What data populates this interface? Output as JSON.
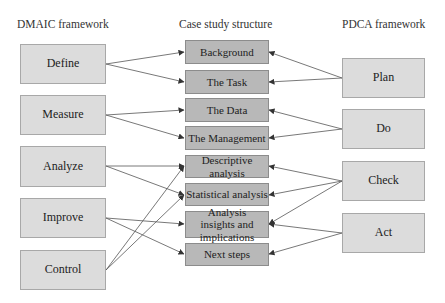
{
  "headings": {
    "left": "DMAIC framework",
    "middle": "Case study structure",
    "right": "PDCA framework"
  },
  "dmaic": [
    "Define",
    "Measure",
    "Analyze",
    "Improve",
    "Control"
  ],
  "case_study": [
    "Background",
    "The Task",
    "The Data",
    "The Management",
    "Descriptive analysis",
    "Statistical analysis",
    "Analysis insights and implications",
    "Next steps"
  ],
  "pdca": [
    "Plan",
    "Do",
    "Check",
    "Act"
  ],
  "connections": {
    "dmaic_to_case": [
      [
        "Define",
        "Background"
      ],
      [
        "Define",
        "The Task"
      ],
      [
        "Measure",
        "The Data"
      ],
      [
        "Measure",
        "The Management"
      ],
      [
        "Analyze",
        "Descriptive analysis"
      ],
      [
        "Analyze",
        "Statistical analysis"
      ],
      [
        "Improve",
        "Analysis insights and implications"
      ],
      [
        "Improve",
        "Next steps"
      ],
      [
        "Control",
        "Descriptive analysis"
      ],
      [
        "Control",
        "Statistical analysis"
      ]
    ],
    "pdca_to_case": [
      [
        "Plan",
        "Background"
      ],
      [
        "Plan",
        "The Task"
      ],
      [
        "Do",
        "The Data"
      ],
      [
        "Do",
        "The Management"
      ],
      [
        "Check",
        "Descriptive analysis"
      ],
      [
        "Check",
        "Statistical analysis"
      ],
      [
        "Check",
        "Analysis insights and implications"
      ],
      [
        "Act",
        "Analysis insights and implications"
      ],
      [
        "Act",
        "Next steps"
      ]
    ]
  },
  "colors": {
    "side_box": "#dcdcdc",
    "middle_box": "#b8b8b8",
    "line": "#555555"
  }
}
